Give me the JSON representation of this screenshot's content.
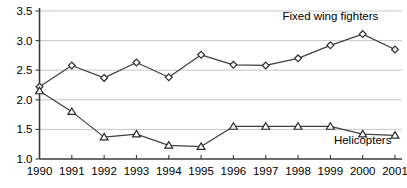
{
  "chart_data": {
    "type": "line",
    "title": "",
    "xlabel": "",
    "ylabel": "",
    "categories": [
      "1990",
      "1991",
      "1992",
      "1993",
      "1994",
      "1995",
      "1996",
      "1997",
      "1998",
      "1999",
      "2000",
      "2001"
    ],
    "ylim": [
      1.0,
      3.5
    ],
    "yticks": [
      "1.0",
      "1.5",
      "2.0",
      "2.5",
      "3.0",
      "3.5"
    ],
    "ytick_values": [
      1.0,
      1.5,
      2.0,
      2.5,
      3.0,
      3.5
    ],
    "grid": true,
    "legend_position": "inline-annotation",
    "series": [
      {
        "name": "Fixed wing fighters",
        "marker": "diamond",
        "label_x": "1999",
        "label_value": 3.35,
        "values": [
          2.22,
          2.58,
          2.37,
          2.63,
          2.38,
          2.76,
          2.59,
          2.58,
          2.7,
          2.92,
          3.11,
          2.85
        ]
      },
      {
        "name": "Helicopters",
        "marker": "triangle",
        "label_x": "2000",
        "label_value": 1.25,
        "values": [
          2.15,
          1.8,
          1.37,
          1.42,
          1.23,
          1.21,
          1.55,
          1.55,
          1.55,
          1.55,
          1.42,
          1.4
        ]
      }
    ],
    "colors": {
      "line": "#3f3f3f",
      "marker_fill": "#ffffff",
      "marker_stroke": "#2c2c2c",
      "grid": "#b9b9b9",
      "axis": "#3b3b3b",
      "background": "#ffffff",
      "text": "#000000"
    }
  }
}
